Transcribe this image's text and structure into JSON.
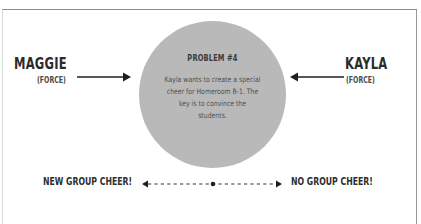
{
  "problem": {
    "title": "PROBLEM #4",
    "body": "Kayla wants to create a special cheer for Homeroom B-1. The key is to convince the students."
  },
  "forces": {
    "left": {
      "name": "MAGGIE",
      "label": "(FORCE)",
      "arrow_direction": "right"
    },
    "right": {
      "name": "KAYLA",
      "label": "(FORCE)",
      "arrow_direction": "left"
    }
  },
  "scale": {
    "left_label": "NEW GROUP CHEER!",
    "right_label": "NO GROUP CHEER!",
    "midpoint": "dot"
  },
  "colors": {
    "circle_fill": "#b9b9b9",
    "text_dark": "#2b2b2b",
    "frame_border": "#8a8a8a",
    "background": "#ffffff"
  }
}
